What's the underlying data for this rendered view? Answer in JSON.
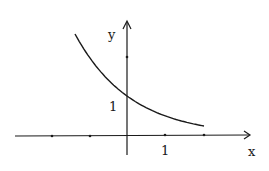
{
  "chart_data": {
    "type": "line",
    "title": "",
    "function": "y = (1/2)^x",
    "xlabel": "x",
    "ylabel": "y",
    "x_tick_label": "1",
    "y_tick_label": "1",
    "x_ticks": [
      -2,
      -1,
      0,
      1,
      2
    ],
    "y_ticks": [
      1,
      2
    ],
    "xlim": [
      -3.2,
      3.2
    ],
    "ylim": [
      -0.6,
      3.2
    ],
    "grid": false,
    "legend": false,
    "series": [
      {
        "name": "curve",
        "x": [
          -1.35,
          -1,
          -0.5,
          0,
          0.5,
          1,
          1.5,
          2
        ],
        "y": [
          2.55,
          2.0,
          1.41,
          1.0,
          0.71,
          0.5,
          0.35,
          0.25
        ]
      }
    ],
    "colors": {
      "line": "#1a1a1a",
      "background": "#ffffff"
    }
  }
}
